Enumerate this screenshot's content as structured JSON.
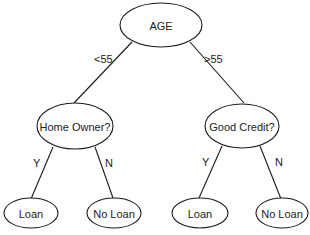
{
  "diagram": {
    "type": "decision-tree",
    "nodes": {
      "root": {
        "label": "AGE"
      },
      "home_owner": {
        "label": "Home Owner?"
      },
      "good_credit": {
        "label": "Good Credit?"
      },
      "leaf_1": {
        "label": "Loan"
      },
      "leaf_2": {
        "label": "No Loan"
      },
      "leaf_3": {
        "label": "Loan"
      },
      "leaf_4": {
        "label": "No Loan"
      }
    },
    "edges": {
      "root_to_home_owner": {
        "label": "<55"
      },
      "root_to_good_credit": {
        "label": ">55"
      },
      "home_owner_to_leaf_1": {
        "label": "Y"
      },
      "home_owner_to_leaf_2": {
        "label": "N"
      },
      "good_credit_to_leaf_3": {
        "label": "Y"
      },
      "good_credit_to_leaf_4": {
        "label": "N"
      }
    }
  }
}
